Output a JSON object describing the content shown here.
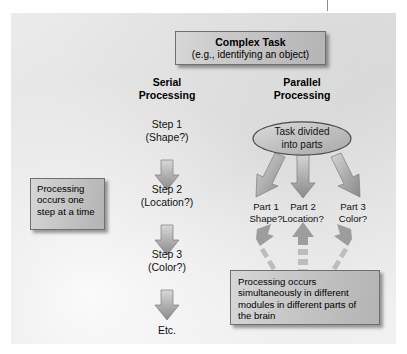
{
  "figure": {
    "title_box": {
      "line1": "Complex Task",
      "line2": "(e.g., identifying an object)"
    },
    "columns": {
      "serial": {
        "heading_line1": "Serial",
        "heading_line2": "Processing",
        "steps": [
          {
            "line1": "Step 1",
            "line2": "(Shape?)"
          },
          {
            "line1": "Step 2",
            "line2": "(Location?)"
          },
          {
            "line1": "Step 3",
            "line2": "(Color?)"
          }
        ],
        "terminator": "Etc.",
        "note_box": "Processing occurs one step at a time"
      },
      "parallel": {
        "heading_line1": "Parallel",
        "heading_line2": "Processing",
        "divider_ellipse_line1": "Task divided",
        "divider_ellipse_line2": "into parts",
        "parts": [
          {
            "line1": "Part 1",
            "line2": "Shape?"
          },
          {
            "line1": "Part 2",
            "line2": "Location?"
          },
          {
            "line1": "Part 3",
            "line2": "Color?"
          }
        ],
        "note_box": "Processing occurs simultaneously in different modules in different parts of the brain"
      }
    },
    "icons": {
      "solid_down_arrow": "down-arrow-icon",
      "dashed_up_arrow": "dashed-up-arrow-icon",
      "diverging_arrow": "diverging-arrow-icon"
    },
    "colors": {
      "panel_light": "#f2f2f2",
      "panel_dark": "#dedede",
      "box_fill_light": "#d7d7d7",
      "box_fill_dark": "#b4b4b4",
      "box_border": "#6f6f6f",
      "arrow_light": "#cfcfcf",
      "arrow_dark": "#8e8e8e",
      "text": "#000000"
    }
  }
}
